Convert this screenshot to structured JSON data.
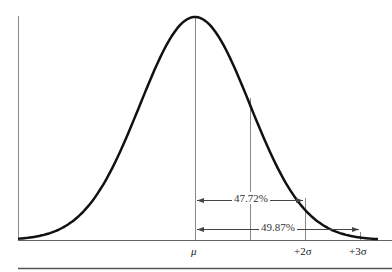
{
  "chart_data": {
    "type": "line",
    "title": "",
    "x_ticks": [
      "μ",
      "+2σ",
      "+3σ"
    ],
    "annotations": [
      {
        "label": "47.72%",
        "from": "μ",
        "to": "+2σ"
      },
      {
        "label": "49.87%",
        "from": "μ",
        "to": "+3σ"
      }
    ],
    "vertical_lines": [
      "μ",
      "+1σ",
      "+2σ",
      "+3σ"
    ]
  },
  "labels": {
    "mu": "μ",
    "plus2sigma": "+2σ",
    "plus3sigma": "+3σ",
    "pct_2sigma": "47.72%",
    "pct_3sigma": "49.87%"
  }
}
